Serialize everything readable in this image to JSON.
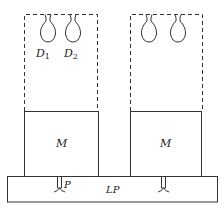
{
  "diagram": {
    "colors": {
      "stroke": "#333333",
      "background": "#ffffff",
      "text": "#222222"
    },
    "labels": {
      "drop1_main": "D",
      "drop1_sub": "1",
      "drop2_main": "D",
      "drop2_sub": "2",
      "module_left": "M",
      "module_right": "M",
      "pipe_left": "P",
      "base_plate": "LP"
    },
    "units": [
      {
        "name": "left",
        "dashed_box": [
          24,
          14,
          97,
          111
        ],
        "module_box": [
          24,
          111,
          98,
          176
        ],
        "drops_x": [
          48,
          73
        ],
        "pipe_x": 59
      },
      {
        "name": "right",
        "dashed_box": [
          130,
          14,
          202,
          111
        ],
        "module_box": [
          130,
          111,
          201,
          176
        ],
        "drops_x": [
          149,
          178
        ],
        "pipe_x": 163
      }
    ],
    "base_plate": [
      7,
      176,
      217,
      202
    ]
  }
}
